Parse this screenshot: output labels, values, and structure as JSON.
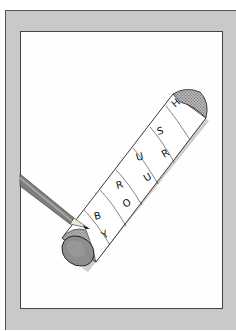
{
  "illustration": {
    "subject": "cylindrical roll of paper with a pencil writing letters",
    "top_row_letters": [
      "B",
      "R",
      "U",
      "S",
      "H"
    ],
    "bottom_row_letters": [
      "Y",
      "O",
      "U",
      "R"
    ],
    "colors": {
      "frame": "#c9c9c9",
      "frame_border": "#555555",
      "canvas": "#fefefe",
      "tube": "#ffffff",
      "tube_end": "#8a8a8a",
      "shadow": "#cfcfcf",
      "pencil": "#7a7a7a"
    }
  }
}
